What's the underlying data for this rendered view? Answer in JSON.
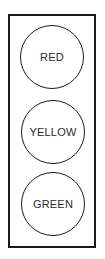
{
  "diagram": {
    "type": "traffic-light",
    "lights": [
      {
        "label": "RED",
        "position": "top"
      },
      {
        "label": "YELLOW",
        "position": "middle"
      },
      {
        "label": "GREEN",
        "position": "bottom"
      }
    ]
  },
  "colors": {
    "stroke": "#1a1a1a",
    "text": "#2a2a2a",
    "background": "#ffffff"
  }
}
